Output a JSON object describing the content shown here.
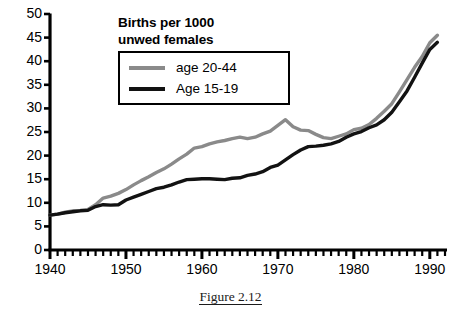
{
  "figure": {
    "caption": "Figure 2.12"
  },
  "legend": {
    "title_line_1": "Births per 1000",
    "title_line_2": "unwed females",
    "entries": [
      {
        "label": "age 20-44",
        "color": "#8a8a8a",
        "series_key": "age_20_44"
      },
      {
        "label": "Age 15-19",
        "color": "#121212",
        "series_key": "age_15_19"
      }
    ]
  },
  "axes": {
    "y_ticks": [
      "0",
      "5",
      "10",
      "15",
      "20",
      "25",
      "30",
      "35",
      "40",
      "45",
      "50"
    ],
    "x_ticks": [
      "1940",
      "1950",
      "1960",
      "1970",
      "1980",
      "1990"
    ]
  },
  "chart_data": {
    "type": "line",
    "title": "Births per 1000 unwed females",
    "xlabel": "",
    "ylabel": "",
    "xlim": [
      1940,
      1992
    ],
    "ylim": [
      0,
      50
    ],
    "grid": false,
    "legend_position": "top-center",
    "x": [
      1940,
      1941,
      1942,
      1943,
      1944,
      1945,
      1946,
      1947,
      1948,
      1949,
      1950,
      1951,
      1952,
      1953,
      1954,
      1955,
      1956,
      1957,
      1958,
      1959,
      1960,
      1961,
      1962,
      1963,
      1964,
      1965,
      1966,
      1967,
      1968,
      1969,
      1970,
      1971,
      1972,
      1973,
      1974,
      1975,
      1976,
      1977,
      1978,
      1979,
      1980,
      1981,
      1982,
      1983,
      1984,
      1985,
      1986,
      1987,
      1988,
      1989,
      1990,
      1991
    ],
    "series": [
      {
        "name": "age 20-44",
        "color": "#8a8a8a",
        "values": [
          7.4,
          7.6,
          8.0,
          8.3,
          8.4,
          8.6,
          9.6,
          11.0,
          11.4,
          12.0,
          12.8,
          13.8,
          14.7,
          15.5,
          16.4,
          17.2,
          18.2,
          19.3,
          20.3,
          21.6,
          21.9,
          22.5,
          22.9,
          23.2,
          23.6,
          23.9,
          23.6,
          23.9,
          24.6,
          25.2,
          26.4,
          27.6,
          26.1,
          25.4,
          25.3,
          24.5,
          23.8,
          23.6,
          24.1,
          24.6,
          25.5,
          25.8,
          26.6,
          27.9,
          29.4,
          31.0,
          33.5,
          36.1,
          38.7,
          41.0,
          43.9,
          45.5
        ]
      },
      {
        "name": "Age 15-19",
        "color": "#121212",
        "values": [
          7.4,
          7.6,
          7.9,
          8.1,
          8.3,
          8.4,
          9.2,
          9.6,
          9.5,
          9.6,
          10.6,
          11.2,
          11.8,
          12.4,
          13.0,
          13.3,
          13.8,
          14.4,
          14.9,
          15.0,
          15.1,
          15.1,
          15.0,
          14.9,
          15.2,
          15.3,
          15.8,
          16.1,
          16.6,
          17.5,
          18.0,
          19.1,
          20.2,
          21.2,
          21.9,
          22.0,
          22.2,
          22.5,
          23.0,
          23.9,
          24.6,
          25.1,
          25.9,
          26.5,
          27.6,
          29.2,
          31.4,
          33.7,
          36.6,
          39.6,
          42.5,
          44.0
        ]
      }
    ]
  }
}
